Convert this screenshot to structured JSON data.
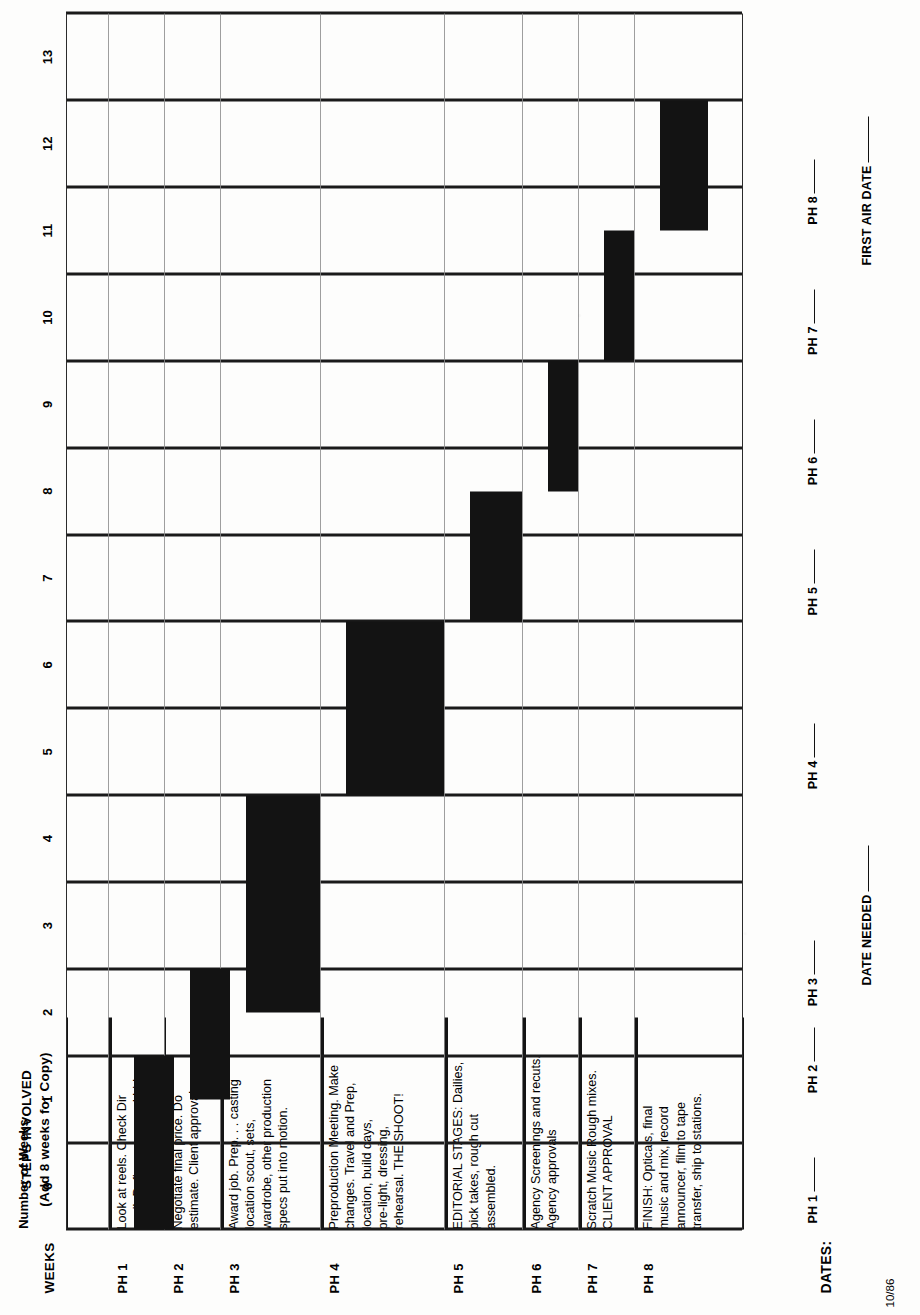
{
  "document": {
    "header_steps_line1": "STEPS INVOLVED",
    "header_steps_line2": "(Add 8 weeks for Copy)",
    "header_weeks": "WEEKS",
    "axis_caption": "Number of Weeks",
    "dates_label": "DATES:",
    "revision_stamp": "10/86",
    "date_needed_label": "DATE NEEDED",
    "first_air_date_label": "FIRST AIR DATE"
  },
  "axis": {
    "ticks": [
      "0",
      "1",
      "2",
      "3",
      "4",
      "5",
      "6",
      "7",
      "8",
      "9",
      "10",
      "11",
      "12",
      "13"
    ],
    "min": -0.5,
    "max": 13.5,
    "unit": "weeks"
  },
  "phases": [
    {
      "code": "PH 1",
      "description": "Look at reels. Check Dir\navail. Define specs and bid.",
      "start_week": -0.5,
      "end_week": 1.5
    },
    {
      "code": "PH 2",
      "description": "Negotiate final price. Do\nestimate. Client approval.",
      "start_week": 1.0,
      "end_week": 2.5
    },
    {
      "code": "PH 3",
      "description": "Award job. Prep. . . casting\nlocation scout, sets,\nwardrobe, other production\nspecs put into motion.",
      "start_week": 2.0,
      "end_week": 4.5
    },
    {
      "code": "PH 4",
      "description": "Preproduction Meeting.  Make\nchanges. Travel and Prep,\nlocation, build days,\npre-light, dressing,\nrehearsal. THE SHOOT!",
      "start_week": 4.5,
      "end_week": 6.5
    },
    {
      "code": "PH 5",
      "description": "EDITORIAL  STAGES:  Dailies,\npick takes, rough cut\nassembled.",
      "start_week": 6.5,
      "end_week": 8.0
    },
    {
      "code": "PH 6",
      "description": "Agency Screenings and recuts.\nAgency approvals",
      "start_week": 8.0,
      "end_week": 9.5
    },
    {
      "code": "PH 7",
      "description": "Scratch Music  Rough mixes.\nCLIENT APPROVAL",
      "start_week": 9.5,
      "end_week": 11.0
    },
    {
      "code": "PH 8",
      "description": "FINISH: Opticals, final\nmusic and mix, record\nannouncer, film to tape\ntransfer, ship to stations.",
      "start_week": 11.0,
      "end_week": 12.5
    }
  ],
  "date_lines": {
    "phase_slots": [
      "PH 1",
      "PH 2",
      "PH 3",
      "PH 4",
      "PH 5",
      "PH 6",
      "PH 7",
      "PH 8"
    ]
  },
  "chart_data": {
    "type": "bar",
    "orientation": "horizontal-gantt",
    "xlabel": "Number of Weeks",
    "ylabel": "",
    "xlim": [
      -0.5,
      13.5
    ],
    "grid": true,
    "legend": "none",
    "categories": [
      "PH 1",
      "PH 2",
      "PH 3",
      "PH 4",
      "PH 5",
      "PH 6",
      "PH 7",
      "PH 8"
    ],
    "series": [
      {
        "name": "Phase duration (weeks)",
        "values": [
          2.0,
          1.5,
          2.5,
          2.0,
          1.5,
          1.5,
          1.5,
          1.5
        ]
      }
    ],
    "spans": [
      {
        "category": "PH 1",
        "start": -0.5,
        "end": 1.5
      },
      {
        "category": "PH 2",
        "start": 1.0,
        "end": 2.5
      },
      {
        "category": "PH 3",
        "start": 2.0,
        "end": 4.5
      },
      {
        "category": "PH 4",
        "start": 4.5,
        "end": 6.5
      },
      {
        "category": "PH 5",
        "start": 6.5,
        "end": 8.0
      },
      {
        "category": "PH 6",
        "start": 8.0,
        "end": 9.5
      },
      {
        "category": "PH 7",
        "start": 9.5,
        "end": 11.0
      },
      {
        "category": "PH 8",
        "start": 11.0,
        "end": 12.5
      }
    ],
    "tick_labels": [
      "0",
      "1",
      "2",
      "3",
      "4",
      "5",
      "6",
      "7",
      "8",
      "9",
      "10",
      "11",
      "12",
      "13"
    ]
  }
}
